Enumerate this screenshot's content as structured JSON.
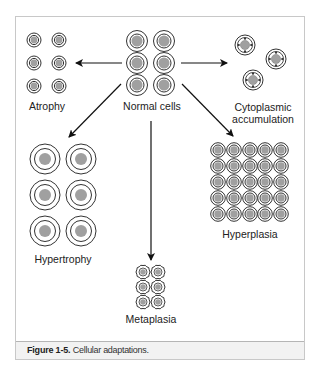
{
  "figure": {
    "title": "Cellular adaptations",
    "caption_label": "Figure 1-5.",
    "caption_text": "Cellular adaptations."
  },
  "labels": {
    "normal": "Normal cells",
    "atrophy": "Atrophy",
    "cytoplasmic_line1": "Cytoplasmic",
    "cytoplasmic_line2": "accumulation",
    "hypertrophy": "Hypertrophy",
    "hyperplasia": "Hyperplasia",
    "metaplasia": "Metaplasia"
  },
  "colors": {
    "stroke": "#333333",
    "nucleus": "#a0a0a0",
    "frame": "#c8c8c8",
    "caption_bg": "#f2f2f2"
  },
  "groups": [
    {
      "name": "Normal cells",
      "cells": 6,
      "layout": "2x3"
    },
    {
      "name": "Atrophy",
      "cells": 6,
      "layout": "2x3"
    },
    {
      "name": "Cytoplasmic accumulation",
      "cells": 3,
      "layout": "scattered"
    },
    {
      "name": "Hypertrophy",
      "cells": 6,
      "layout": "2x3"
    },
    {
      "name": "Hyperplasia",
      "cells": 25,
      "layout": "5x5"
    },
    {
      "name": "Metaplasia",
      "cells": 6,
      "layout": "2x3"
    }
  ]
}
